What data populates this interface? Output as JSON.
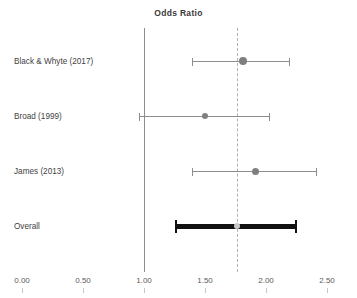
{
  "chart_data": {
    "type": "scatter",
    "subtype": "forest-plot",
    "title": "Odds Ratio",
    "xlabel": "",
    "ylabel": "",
    "xlim": [
      0.0,
      2.5
    ],
    "grid": false,
    "legend": "none",
    "reference_line": {
      "value": 1.0,
      "style": "solid",
      "color": "#8d8d8d",
      "label": "null-effect-axis"
    },
    "pooled_line": {
      "value": 1.76,
      "style": "dashed",
      "color": "#b0b0b0",
      "label": "pooled-estimate"
    },
    "xticks": [
      {
        "value": 0.0,
        "label": "0.00"
      },
      {
        "value": 0.5,
        "label": "0.50"
      },
      {
        "value": 1.0,
        "label": "1.00"
      },
      {
        "value": 1.5,
        "label": "1.50"
      },
      {
        "value": 2.0,
        "label": "2.00"
      },
      {
        "value": 2.5,
        "label": "2.50"
      }
    ],
    "categories": [
      "Black & Whyte (2017)",
      "Broad (1999)",
      "James (2013)",
      "Overall"
    ],
    "rows": [
      {
        "label": "Black & Whyte (2017)",
        "estimate": 1.81,
        "ci_low": 1.39,
        "ci_high": 2.2,
        "marker_size": 8,
        "kind": "study",
        "color": "#7f7f7f"
      },
      {
        "label": "Broad (1999)",
        "estimate": 1.5,
        "ci_low": 0.96,
        "ci_high": 2.03,
        "marker_size": 6,
        "kind": "study",
        "color": "#7f7f7f"
      },
      {
        "label": "James (2013)",
        "estimate": 1.91,
        "ci_low": 1.39,
        "ci_high": 2.42,
        "marker_size": 7,
        "kind": "study",
        "color": "#7f7f7f"
      },
      {
        "label": "Overall",
        "estimate": 1.76,
        "ci_low": 1.25,
        "ci_high": 2.25,
        "marker_size": 6,
        "kind": "pooled",
        "color": "#c9c9c9"
      }
    ]
  },
  "layout": {
    "plot_left_px": 22,
    "plot_right_px": 327,
    "axis_top_px": 28,
    "axis_bottom_px": 272,
    "row_tops_px": [
      50,
      105,
      160,
      215
    ],
    "tick_label_y_px": 276,
    "tick_mark_y_px": 288
  }
}
